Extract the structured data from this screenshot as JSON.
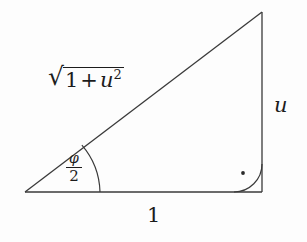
{
  "figure": {
    "background_color": "#fdfdfd",
    "stroke_color": "#1c1c1c",
    "labels": {
      "hypotenuse": {
        "radical": "√",
        "radicand_first": "1",
        "radicand_operator": "+",
        "radicand_variable": "u",
        "radicand_exponent": "2",
        "full_text": "√(1 + u²)"
      },
      "vertical_leg": "u",
      "base_leg": "1",
      "angle": {
        "numerator": "φ",
        "denominator": "2",
        "full_text": "φ/2"
      },
      "right_angle_marker": "·"
    },
    "geometry": {
      "vertex_left": [
        25,
        192
      ],
      "vertex_bottom_right": [
        262,
        192
      ],
      "vertex_top_right": [
        262,
        12
      ],
      "angle_arc_radius": 75,
      "right_angle_arc_radius": 28,
      "right_angle_dot": [
        243,
        173
      ]
    }
  }
}
